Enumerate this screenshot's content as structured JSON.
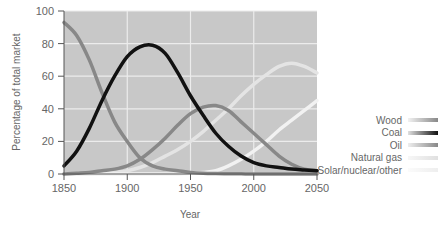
{
  "chart_data": {
    "type": "line",
    "title": "",
    "xlabel": "Year",
    "ylabel": "Percentage of total market",
    "xlim": [
      1850,
      2050
    ],
    "ylim": [
      0,
      100
    ],
    "x_ticks": [
      1850,
      1900,
      1950,
      2000,
      2050
    ],
    "y_ticks": [
      0,
      20,
      40,
      60,
      80,
      100
    ],
    "grid": true,
    "legend_position": "right",
    "x": [
      1850,
      1860,
      1870,
      1880,
      1890,
      1900,
      1910,
      1920,
      1930,
      1940,
      1950,
      1960,
      1970,
      1980,
      1990,
      2000,
      2010,
      2020,
      2030,
      2040,
      2050
    ],
    "series": [
      {
        "name": "Wood",
        "color": "#888888",
        "values": [
          93,
          85,
          70,
          50,
          32,
          20,
          10,
          5,
          3,
          2,
          1,
          0.5,
          0.3,
          0.2,
          0.1,
          0,
          0,
          0,
          0,
          0,
          0
        ]
      },
      {
        "name": "Coal",
        "color": "#111111",
        "values": [
          5,
          14,
          28,
          45,
          60,
          72,
          78,
          79,
          74,
          62,
          48,
          36,
          25,
          17,
          11,
          7,
          5,
          4,
          3,
          2.5,
          2
        ]
      },
      {
        "name": "Oil",
        "color": "#888888",
        "values": [
          0,
          0.5,
          1,
          2,
          3,
          5,
          9,
          15,
          22,
          30,
          37,
          41,
          42,
          39,
          32,
          25,
          18,
          11,
          6,
          3,
          2
        ]
      },
      {
        "name": "Natural gas",
        "color": "#e4e4e4",
        "values": [
          0,
          0,
          0,
          0.5,
          1,
          2,
          4,
          7,
          11,
          15,
          20,
          26,
          33,
          40,
          48,
          55,
          61,
          66,
          68,
          66,
          62
        ]
      },
      {
        "name": "Solar/nuclear/other",
        "color": "#f2f2f2",
        "values": [
          0,
          0,
          0,
          0,
          0,
          0,
          0,
          0,
          0,
          0,
          0.5,
          1,
          2,
          5,
          9,
          14,
          20,
          27,
          33,
          39,
          45
        ]
      }
    ]
  },
  "legend": {
    "items": [
      {
        "label": "Wood",
        "gradient": [
          "#f2f2f2",
          "#888888"
        ]
      },
      {
        "label": "Coal",
        "gradient": [
          "#e0e0e0",
          "#111111"
        ]
      },
      {
        "label": "Oil",
        "gradient": [
          "#eeeeee",
          "#888888"
        ]
      },
      {
        "label": "Natural gas",
        "gradient": [
          "#f7f7f7",
          "#e0e0e0"
        ]
      },
      {
        "label": "Solar/nuclear/other",
        "gradient": [
          "#fbfbfb",
          "#eeeeee"
        ]
      }
    ]
  },
  "style": {
    "plot_bg": "#c8c8c8",
    "grid_color": "#ececec",
    "axis_color": "#555555"
  }
}
